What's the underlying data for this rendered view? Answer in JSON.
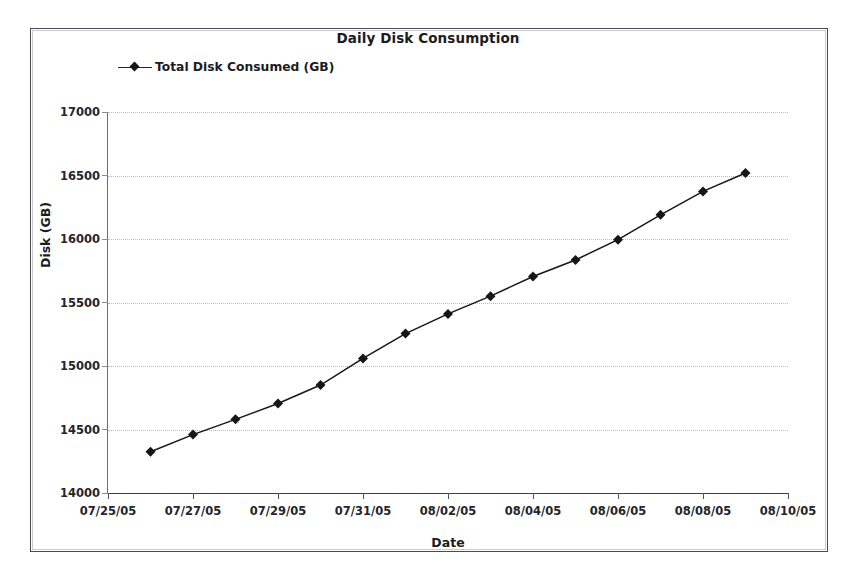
{
  "chart_data": {
    "type": "line",
    "title": "Daily Disk Consumption",
    "xlabel": "Date",
    "ylabel": "Disk (GB)",
    "grid": true,
    "legend_position": "top-left",
    "xlim": [
      "07/25/05",
      "08/10/05"
    ],
    "ylim": [
      14000,
      17000
    ],
    "ytick_labels": [
      "17000",
      "16500",
      "16000",
      "15500",
      "15000",
      "14500",
      "14000"
    ],
    "ytick_values": [
      17000,
      16500,
      16000,
      15500,
      15000,
      14500,
      14000
    ],
    "xtick_labels": [
      "07/25/05",
      "07/27/05",
      "07/29/05",
      "07/31/05",
      "08/02/05",
      "08/04/05",
      "08/06/05",
      "08/08/05",
      "08/10/05"
    ],
    "series": [
      {
        "name": "Total Disk Consumed (GB)",
        "marker": "diamond",
        "color": "#161616",
        "x": [
          "07/26/05",
          "07/27/05",
          "07/28/05",
          "07/29/05",
          "07/30/05",
          "07/31/05",
          "08/01/05",
          "08/02/05",
          "08/03/05",
          "08/04/05",
          "08/05/05",
          "08/06/05",
          "08/07/05",
          "08/08/05",
          "08/09/05"
        ],
        "values": [
          14325,
          14460,
          14580,
          14705,
          14850,
          15060,
          15255,
          15410,
          15550,
          15705,
          15835,
          15995,
          16190,
          16375,
          16520
        ]
      }
    ]
  },
  "legend": {
    "entries": [
      {
        "label": "Total Disk Consumed (GB)"
      }
    ]
  }
}
